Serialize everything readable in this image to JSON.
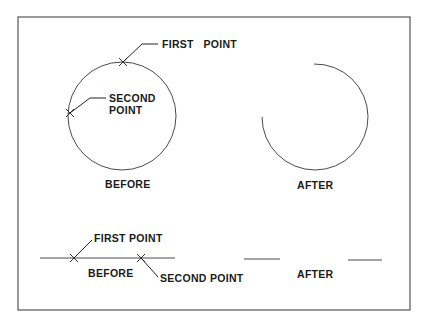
{
  "diagram": {
    "frame": {
      "x": 18,
      "y": 17,
      "width": 392,
      "height": 293
    },
    "circle_example": {
      "before": {
        "center": [
          122,
          116
        ],
        "radius": 54,
        "first_point": {
          "pos": [
            123,
            62
          ],
          "label": "FIRST   POINT",
          "leader": [
            [
              123,
              62
            ],
            [
              142,
              44
            ],
            [
              158,
              44
            ]
          ],
          "label_pos": [
            162,
            48
          ]
        },
        "second_point": {
          "pos": [
            70,
            113
          ],
          "label_line1": "SECOND",
          "label_line2": "POINT",
          "leader": [
            [
              70,
              113
            ],
            [
              90,
              98
            ],
            [
              106,
              98
            ]
          ],
          "label_pos": [
            109,
            102
          ],
          "label_pos2": [
            109,
            114
          ]
        },
        "caption": "BEFORE",
        "caption_pos": [
          105,
          188
        ]
      },
      "after": {
        "center": [
          314,
          117
        ],
        "radius": 53,
        "arc_start": [
          314,
          64
        ],
        "arc_end": [
          262,
          117
        ],
        "caption": "AFTER",
        "caption_pos": [
          297,
          189
        ]
      }
    },
    "line_example": {
      "before": {
        "line": [
          [
            40,
            258
          ],
          [
            175,
            258
          ]
        ],
        "first_point": {
          "pos": [
            74,
            258
          ],
          "label": "FIRST POINT",
          "leader": [
            [
              74,
              258
            ],
            [
              92,
              240
            ]
          ],
          "label_pos": [
            94,
            242
          ]
        },
        "second_point": {
          "pos": [
            141,
            258
          ],
          "label": "SECOND POINT",
          "leader": [
            [
              141,
              258
            ],
            [
              158,
              277
            ]
          ],
          "label_pos": [
            160,
            282
          ]
        },
        "caption": "BEFORE",
        "caption_pos": [
          88,
          277
        ]
      },
      "after": {
        "segments": [
          [
            [
              244,
              259
            ],
            [
              280,
              259
            ]
          ],
          [
            [
              348,
              260
            ],
            [
              382,
              260
            ]
          ]
        ],
        "caption": "AFTER",
        "caption_pos": [
          297,
          278
        ]
      }
    }
  }
}
